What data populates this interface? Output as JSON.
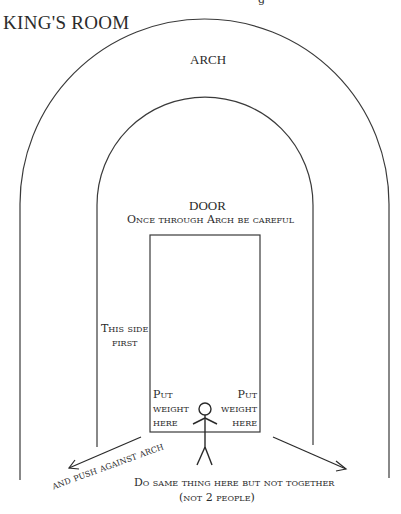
{
  "diagram": {
    "title": "KING'S ROOM",
    "top_cut_text": "g",
    "arch_label": "ARCH",
    "door_label": "DOOR",
    "door_note": "Once through Arch be careful",
    "side_note_line1": "This side",
    "side_note_line2": "first",
    "put_weight_left": [
      "Put",
      "weight",
      "here"
    ],
    "put_weight_right": [
      "Put",
      "weight",
      "here"
    ],
    "push_note": "and push against arch",
    "same_note": "Do same thing here but not together",
    "not_two_note": "(not 2 people)",
    "icons": {
      "figure": "stick-figure-icon",
      "arrow_left": "arrow-down-left-icon",
      "arrow_right": "arrow-down-right-icon"
    },
    "colors": {
      "line": "#3a3a3a",
      "text": "#2b2b2b",
      "background": "#ffffff"
    }
  }
}
